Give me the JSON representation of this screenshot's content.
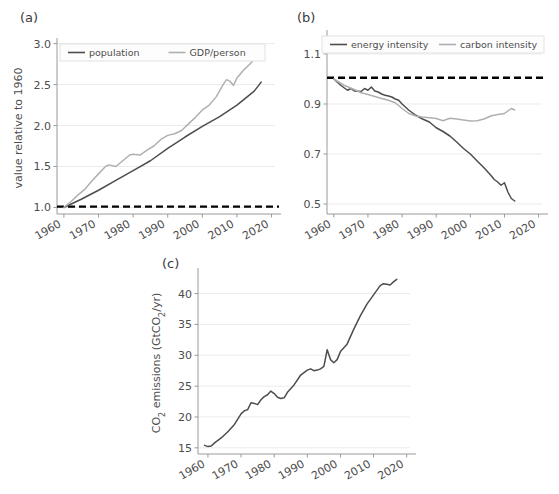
{
  "figure": {
    "background": "#ffffff",
    "grid_color": "#ebebeb",
    "axis_color": "#9a9a9a",
    "dark_line": "#4d4d4d",
    "light_line": "#b0b0b0",
    "ref_line": "#000000"
  },
  "panels": {
    "a": {
      "label": "(a)"
    },
    "b": {
      "label": "(b)"
    },
    "c": {
      "label": "(c)"
    }
  },
  "chart_data": [
    {
      "id": "panel-a",
      "type": "line",
      "title": "(a)",
      "xlabel": "",
      "ylabel": "value relative to 1960",
      "xlim": [
        1958,
        2021
      ],
      "ylim": [
        0.92,
        3.02
      ],
      "xticks": [
        1960,
        1970,
        1980,
        1990,
        2000,
        2010,
        2020
      ],
      "xticklabels": [
        "1960",
        "1970",
        "1980",
        "1990",
        "2000",
        "2010",
        "2020"
      ],
      "yticks": [
        1.0,
        1.5,
        2.0,
        2.5,
        3.0
      ],
      "yticklabels": [
        "1.0",
        "1.5",
        "2.0",
        "2.5",
        "3.0"
      ],
      "grid": true,
      "legend": {
        "position": "upper-left",
        "entries": [
          "population",
          "GDP/person"
        ]
      },
      "reference_line": {
        "label": "1.0 baseline",
        "style": "dashed",
        "color": "#000000",
        "value": 1.01
      },
      "series": [
        {
          "name": "population",
          "color": "#4d4d4d",
          "x": [
            1960,
            1965,
            1970,
            1975,
            1980,
            1985,
            1990,
            1995,
            2000,
            2005,
            2010,
            2015,
            2017
          ],
          "values": [
            1.0,
            1.1,
            1.21,
            1.33,
            1.45,
            1.57,
            1.72,
            1.86,
            1.99,
            2.11,
            2.25,
            2.42,
            2.53
          ]
        },
        {
          "name": "GDP/person",
          "color": "#b0b0b0",
          "x": [
            1960,
            1962,
            1964,
            1966,
            1968,
            1970,
            1972,
            1973,
            1975,
            1977,
            1979,
            1980,
            1982,
            1984,
            1986,
            1988,
            1990,
            1992,
            1994,
            1996,
            1998,
            2000,
            2002,
            2004,
            2006,
            2007,
            2008,
            2009,
            2010,
            2012,
            2014,
            2016,
            2017
          ],
          "values": [
            1.0,
            1.07,
            1.15,
            1.22,
            1.32,
            1.41,
            1.5,
            1.52,
            1.5,
            1.57,
            1.64,
            1.65,
            1.64,
            1.7,
            1.75,
            1.83,
            1.88,
            1.9,
            1.94,
            2.02,
            2.1,
            2.19,
            2.25,
            2.35,
            2.5,
            2.56,
            2.54,
            2.49,
            2.58,
            2.68,
            2.76,
            2.87,
            2.93
          ]
        }
      ]
    },
    {
      "id": "panel-b",
      "type": "line",
      "title": "(b)",
      "xlabel": "",
      "ylabel": "",
      "xlim": [
        1958,
        2021
      ],
      "ylim": [
        0.46,
        1.18
      ],
      "xticks": [
        1960,
        1970,
        1980,
        1990,
        2000,
        2010,
        2020
      ],
      "xticklabels": [
        "1960",
        "1970",
        "1980",
        "1990",
        "2000",
        "2010",
        "2020"
      ],
      "yticks": [
        0.5,
        0.7,
        0.9,
        1.1
      ],
      "yticklabels": [
        "0.5",
        "0.7",
        "0.9",
        "1.1"
      ],
      "grid": true,
      "legend": {
        "position": "upper-center",
        "entries": [
          "energy intensity",
          "carbon intensity"
        ]
      },
      "reference_line": {
        "label": "1.0 baseline",
        "style": "dashed",
        "color": "#000000",
        "value": 1.005
      },
      "series": [
        {
          "name": "energy intensity",
          "color": "#4d4d4d",
          "x": [
            1960,
            1962,
            1964,
            1965,
            1966,
            1968,
            1969,
            1970,
            1971,
            1972,
            1973,
            1974,
            1975,
            1976,
            1977,
            1978,
            1979,
            1980,
            1982,
            1984,
            1986,
            1988,
            1990,
            1992,
            1994,
            1996,
            1998,
            2000,
            2002,
            2004,
            2006,
            2007,
            2008,
            2009,
            2010,
            2011,
            2012,
            2013
          ],
          "values": [
            1.0,
            0.975,
            0.955,
            0.962,
            0.952,
            0.95,
            0.962,
            0.955,
            0.968,
            0.952,
            0.948,
            0.94,
            0.935,
            0.932,
            0.928,
            0.92,
            0.915,
            0.9,
            0.875,
            0.855,
            0.84,
            0.828,
            0.805,
            0.79,
            0.772,
            0.748,
            0.722,
            0.7,
            0.672,
            0.645,
            0.615,
            0.598,
            0.588,
            0.575,
            0.585,
            0.548,
            0.522,
            0.512
          ]
        },
        {
          "name": "carbon intensity",
          "color": "#b0b0b0",
          "x": [
            1960,
            1963,
            1966,
            1968,
            1970,
            1972,
            1974,
            1976,
            1978,
            1980,
            1982,
            1984,
            1986,
            1988,
            1990,
            1992,
            1994,
            1996,
            1998,
            2000,
            2002,
            2004,
            2006,
            2008,
            2010,
            2012,
            2013
          ],
          "values": [
            1.0,
            0.975,
            0.958,
            0.945,
            0.938,
            0.93,
            0.922,
            0.915,
            0.905,
            0.882,
            0.862,
            0.852,
            0.848,
            0.845,
            0.842,
            0.833,
            0.843,
            0.84,
            0.836,
            0.832,
            0.833,
            0.84,
            0.852,
            0.858,
            0.862,
            0.882,
            0.876
          ]
        }
      ]
    },
    {
      "id": "panel-c",
      "type": "line",
      "title": "(c)",
      "xlabel": "",
      "ylabel": "CO2 emissions (GtCO2/yr)",
      "ylabel_parts": [
        "CO",
        "2",
        " emissions (GtCO",
        "2",
        "/yr)"
      ],
      "xlim": [
        1957,
        2021
      ],
      "ylim": [
        14,
        43.5
      ],
      "xticks": [
        1960,
        1970,
        1980,
        1990,
        2000,
        2010,
        2020
      ],
      "xticklabels": [
        "1960",
        "1970",
        "1980",
        "1990",
        "2000",
        "2010",
        "2020"
      ],
      "yticks": [
        15,
        20,
        25,
        30,
        35,
        40
      ],
      "yticklabels": [
        "15",
        "20",
        "25",
        "30",
        "35",
        "40"
      ],
      "grid": true,
      "legend": null,
      "series": [
        {
          "name": "CO2 emissions",
          "color": "#4d4d4d",
          "x": [
            1959,
            1960,
            1961,
            1962,
            1964,
            1966,
            1968,
            1970,
            1971,
            1972,
            1973,
            1974,
            1975,
            1976,
            1977,
            1978,
            1979,
            1980,
            1981,
            1982,
            1983,
            1984,
            1986,
            1988,
            1990,
            1991,
            1992,
            1993,
            1994,
            1995,
            1996,
            1997,
            1998,
            1999,
            2000,
            2002,
            2004,
            2006,
            2008,
            2010,
            2012,
            2013,
            2014,
            2015,
            2016,
            2017
          ],
          "values": [
            15.4,
            15.2,
            15.3,
            15.8,
            16.6,
            17.6,
            18.8,
            20.5,
            21.0,
            21.2,
            22.3,
            22.2,
            22.0,
            22.8,
            23.3,
            23.6,
            24.2,
            23.8,
            23.2,
            23.0,
            23.1,
            24.0,
            25.2,
            26.8,
            27.6,
            27.8,
            27.5,
            27.6,
            27.8,
            28.2,
            30.9,
            29.3,
            28.8,
            29.3,
            30.6,
            31.8,
            34.2,
            36.4,
            38.3,
            39.8,
            41.3,
            41.6,
            41.5,
            41.4,
            41.9,
            42.3
          ]
        }
      ]
    }
  ]
}
